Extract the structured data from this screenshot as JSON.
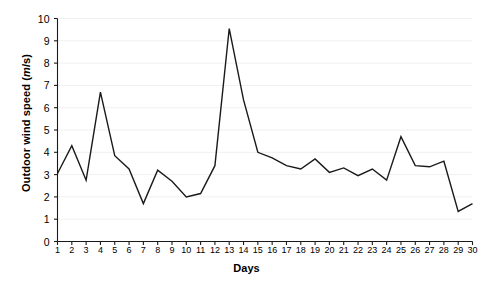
{
  "chart_data": {
    "type": "line",
    "title": "",
    "xlabel": "Days",
    "ylabel": "Outdoor wind speed (m/s)",
    "ylabel_unit_italic": "m",
    "grid": true,
    "legend": "none",
    "xlim": [
      1,
      30
    ],
    "ylim": [
      0,
      10
    ],
    "ytick_labels": [
      "0",
      "1",
      "2",
      "3",
      "4",
      "5",
      "6",
      "7",
      "8",
      "9",
      "10"
    ],
    "yticks": [
      0,
      1,
      2,
      3,
      4,
      5,
      6,
      7,
      8,
      9,
      10
    ],
    "categories": [
      1,
      2,
      3,
      4,
      5,
      6,
      7,
      8,
      9,
      10,
      11,
      12,
      13,
      14,
      15,
      16,
      17,
      18,
      19,
      20,
      21,
      22,
      23,
      24,
      25,
      26,
      27,
      28,
      29,
      30
    ],
    "xtick_labels": [
      "1",
      "2",
      "3",
      "4",
      "5",
      "6",
      "7",
      "8",
      "9",
      "10",
      "11",
      "12",
      "13",
      "14",
      "15",
      "16",
      "17",
      "18",
      "19",
      "20",
      "21",
      "22",
      "23",
      "24",
      "25",
      "26",
      "27",
      "28",
      "29",
      "30"
    ],
    "series": [
      {
        "name": "Outdoor wind speed",
        "color": "#1a1a1a",
        "values": [
          3.05,
          4.3,
          2.75,
          6.7,
          3.85,
          3.25,
          1.7,
          3.2,
          2.7,
          2.0,
          2.15,
          3.4,
          9.55,
          6.35,
          4.0,
          3.75,
          3.4,
          3.25,
          3.7,
          3.1,
          3.3,
          2.95,
          3.25,
          2.75,
          4.7,
          3.4,
          3.35,
          3.6,
          1.35,
          1.7
        ]
      }
    ]
  },
  "figure": {
    "background_color": "#ffffff",
    "grid_color": "#f0f0f0",
    "axis_color": "#1a1a1a",
    "line_width": 1.4
  }
}
